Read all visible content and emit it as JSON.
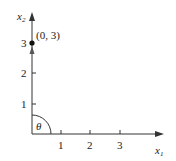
{
  "diagram": {
    "x_axis": {
      "label": "x",
      "sub": "1",
      "ticks": [
        "1",
        "2",
        "3"
      ]
    },
    "y_axis": {
      "label": "x",
      "sub": "2",
      "ticks": [
        "1",
        "2",
        "3"
      ]
    },
    "point": {
      "label": "(0, 3)",
      "x": 0,
      "y": 3
    },
    "angle": {
      "label": "θ"
    }
  }
}
